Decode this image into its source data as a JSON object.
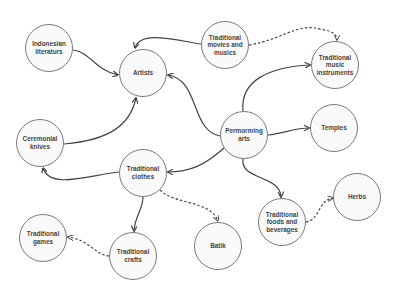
{
  "diagram": {
    "title": "",
    "nodes": [
      {
        "id": "indonesian-literaturs",
        "label": "Indonesian\nliteraturs",
        "cx": 49,
        "cy": 48
      },
      {
        "id": "artists",
        "label": "Artists",
        "cx": 143,
        "cy": 73
      },
      {
        "id": "traditional-movies-and-musics",
        "label": "Traditional\nmovies and\nmusics",
        "cx": 225,
        "cy": 45
      },
      {
        "id": "traditional-music-instruments",
        "label": "Traditional\nmusic\ninstruments",
        "cx": 335,
        "cy": 65
      },
      {
        "id": "permorming-arts",
        "label": "Permorming\narts",
        "cx": 244,
        "cy": 135
      },
      {
        "id": "temples",
        "label": "Temples",
        "cx": 334,
        "cy": 128
      },
      {
        "id": "ceremonial-knives",
        "label": "Ceremonial\nknives",
        "cx": 40,
        "cy": 143
      },
      {
        "id": "traditional-clothes",
        "label": "Traditional\nclothes",
        "cx": 143,
        "cy": 173
      },
      {
        "id": "traditional-games",
        "label": "Traditional\ngames",
        "cx": 43,
        "cy": 238
      },
      {
        "id": "traditional-crafts",
        "label": "Traditional\ncrafts",
        "cx": 133,
        "cy": 256
      },
      {
        "id": "batik",
        "label": "Batik",
        "cx": 218,
        "cy": 246
      },
      {
        "id": "traditional-foods-and-beverages",
        "label": "Traditional\nfoods and\nbeverages",
        "cx": 282,
        "cy": 222
      },
      {
        "id": "herbs",
        "label": "Herbs",
        "cx": 357,
        "cy": 197
      }
    ],
    "edges": [
      {
        "from": "indonesian-literaturs",
        "to": "artists",
        "style": "solid",
        "path": "M73,50 C90,52 95,70 118,75"
      },
      {
        "from": "traditional-movies-and-musics",
        "to": "artists",
        "style": "solid",
        "path": "M201,44 C175,40 140,30 135,48"
      },
      {
        "from": "permorming-arts",
        "to": "artists",
        "style": "solid",
        "path": "M220,136 C190,130 200,80 168,75"
      },
      {
        "from": "ceremonial-knives",
        "to": "artists",
        "style": "solid",
        "path": "M64,144 C110,140 130,125 136,98"
      },
      {
        "from": "traditional-movies-and-musics",
        "to": "traditional-music-instruments",
        "style": "dashed",
        "path": "M249,45 C280,40 295,25 315,28 C322,30 337,30 337,40"
      },
      {
        "from": "permorming-arts",
        "to": "traditional-music-instruments",
        "style": "solid",
        "path": "M243,111 C240,80 270,67 310,65"
      },
      {
        "from": "permorming-arts",
        "to": "temples",
        "style": "solid",
        "path": "M268,135 C285,133 295,128 309,128"
      },
      {
        "from": "permorming-arts",
        "to": "traditional-clothes",
        "style": "solid",
        "path": "M224,148 C205,165 190,172 168,172"
      },
      {
        "from": "permorming-arts",
        "to": "traditional-foods-and-beverages",
        "style": "solid",
        "path": "M243,159 C240,180 280,175 281,197"
      },
      {
        "from": "traditional-clothes",
        "to": "ceremonial-knives",
        "style": "solid",
        "path": "M119,172 C90,175 50,190 43,168"
      },
      {
        "from": "traditional-clothes",
        "to": "traditional-crafts",
        "style": "solid",
        "path": "M143,197 C143,210 135,215 134,231"
      },
      {
        "from": "traditional-clothes",
        "to": "batik",
        "style": "dashed",
        "path": "M160,190 C175,205 210,200 218,221"
      },
      {
        "from": "traditional-crafts",
        "to": "traditional-games",
        "style": "dashed",
        "path": "M109,256 C95,255 90,240 68,237"
      },
      {
        "from": "traditional-foods-and-beverages",
        "to": "herbs",
        "style": "dashed",
        "path": "M306,222 C320,220 318,200 333,198"
      }
    ]
  }
}
